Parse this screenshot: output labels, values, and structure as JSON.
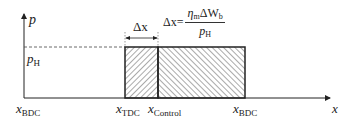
{
  "diagram": {
    "y_axis": {
      "label": "p"
    },
    "x_axis": {
      "label": "x"
    },
    "pressure_level": {
      "label": "p",
      "label_sub": "H"
    },
    "positions": [
      {
        "label": "x",
        "sub": "BDC",
        "role": "left-bottom-dead-center"
      },
      {
        "label": "x",
        "sub": "TDC",
        "role": "top-dead-center"
      },
      {
        "label": "x",
        "sub": "Control",
        "role": "control-position"
      },
      {
        "label": "x",
        "sub": "BDC",
        "role": "right-bottom-dead-center"
      }
    ],
    "dimension": {
      "label": "Δx"
    },
    "formula": {
      "lhs": "Δx=",
      "numerator": "η",
      "numerator_sub": "m",
      "numerator_mid": "ΔW",
      "numerator_sub2": "b",
      "denominator": "p",
      "denominator_sub": "H"
    },
    "regions": [
      {
        "name": "stroke-delta-region",
        "hatch": "forward-diagonal"
      },
      {
        "name": "remaining-stroke-region",
        "hatch": "backward-diagonal"
      }
    ],
    "colors": {
      "line": "#222222",
      "hatch": "#555555",
      "background": "#ffffff"
    }
  }
}
